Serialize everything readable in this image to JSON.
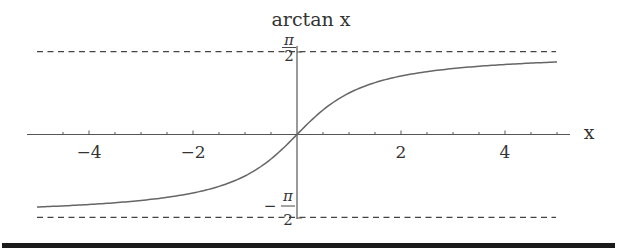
{
  "chart_data": {
    "type": "line",
    "title": "arctan x",
    "xlabel": "x",
    "ylabel": "arctan x",
    "function": "arctan(x)",
    "xlim": [
      -5,
      5
    ],
    "ylim": [
      -1.5708,
      1.5708
    ],
    "x_ticks": [
      -4,
      -2,
      2,
      4
    ],
    "x_tick_labels": [
      "−4",
      "−2",
      "2",
      "4"
    ],
    "x_minor_step": 0.5,
    "y_tick_labels": [
      {
        "value": 1.5708,
        "numerator": "π",
        "denominator": "2",
        "sign": ""
      },
      {
        "value": -1.5708,
        "numerator": "π",
        "denominator": "2",
        "sign": "−"
      }
    ],
    "asymptotes": [
      {
        "y": 1.5708,
        "style": "dashed",
        "label": "π/2"
      },
      {
        "y": -1.5708,
        "style": "dashed",
        "label": "−π/2"
      }
    ],
    "series": [
      {
        "name": "arctan x",
        "x": [
          -5,
          -4,
          -3,
          -2,
          -1.5,
          -1,
          -0.5,
          0,
          0.5,
          1,
          1.5,
          2,
          3,
          4,
          5
        ],
        "values": [
          -1.3734,
          -1.3258,
          -1.249,
          -1.1071,
          -0.9828,
          -0.7854,
          -0.4636,
          0,
          0.4636,
          0.7854,
          0.9828,
          1.1071,
          1.249,
          1.3258,
          1.3734
        ],
        "color": "#666666"
      }
    ],
    "grid": false,
    "legend": "none"
  },
  "labels": {
    "title": "arctan x",
    "x_axis": "x",
    "top_num": "π",
    "top_den": "2",
    "bot_sign": "−",
    "bot_num": "π",
    "bot_den": "2"
  },
  "colors": {
    "curve": "#666666",
    "axis": "#555555",
    "dashes": "#444444",
    "bar": "#1a1a1a"
  }
}
